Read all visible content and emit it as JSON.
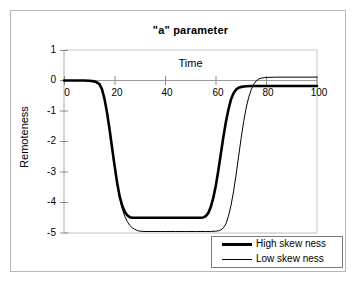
{
  "chart_data": {
    "type": "line",
    "title": "\"a\" parameter",
    "xlabel": "Time",
    "ylabel": "Remoteness",
    "xlim": [
      0,
      100
    ],
    "ylim": [
      -5,
      1
    ],
    "xticks": [
      0,
      20,
      40,
      60,
      80,
      100
    ],
    "yticks": [
      1,
      0,
      -1,
      -2,
      -3,
      -4,
      -5
    ],
    "xtick_labels": [
      "0",
      "20",
      "40",
      "60",
      "80",
      "100"
    ],
    "ytick_labels": [
      "1",
      "0",
      "-1",
      "-2",
      "-3",
      "-4",
      "-5"
    ],
    "grid": false,
    "legend_position": "bottom-right",
    "series": [
      {
        "name": "High skew ness",
        "color": "#000000",
        "linewidth": 2.6,
        "x": [
          0,
          2,
          4,
          6,
          8,
          10,
          12,
          13,
          14,
          15,
          16,
          17,
          18,
          19,
          20,
          21,
          22,
          23,
          24,
          25,
          26,
          27,
          28,
          30,
          34,
          38,
          42,
          46,
          50,
          52,
          54,
          55,
          56,
          57,
          58,
          59,
          60,
          61,
          62,
          63,
          64,
          65,
          66,
          67,
          68,
          69,
          70,
          72,
          74,
          76,
          80,
          85,
          90,
          95,
          100
        ],
        "y": [
          0,
          0,
          0,
          0,
          0,
          -0.01,
          -0.03,
          -0.06,
          -0.12,
          -0.28,
          -0.6,
          -1.05,
          -1.6,
          -2.2,
          -2.8,
          -3.35,
          -3.8,
          -4.1,
          -4.3,
          -4.42,
          -4.48,
          -4.5,
          -4.5,
          -4.5,
          -4.5,
          -4.5,
          -4.5,
          -4.5,
          -4.5,
          -4.5,
          -4.5,
          -4.49,
          -4.45,
          -4.35,
          -4.15,
          -3.85,
          -3.45,
          -2.95,
          -2.4,
          -1.85,
          -1.35,
          -0.95,
          -0.62,
          -0.42,
          -0.3,
          -0.24,
          -0.21,
          -0.19,
          -0.18,
          -0.18,
          -0.18,
          -0.18,
          -0.18,
          -0.18,
          -0.18
        ]
      },
      {
        "name": "Low skew ness",
        "color": "#000000",
        "linewidth": 1.0,
        "x": [
          0,
          2,
          4,
          6,
          8,
          10,
          12,
          14,
          15,
          16,
          17,
          18,
          19,
          20,
          21,
          22,
          23,
          24,
          25,
          26,
          27,
          28,
          29,
          30,
          32,
          36,
          40,
          44,
          48,
          52,
          56,
          58,
          60,
          61,
          62,
          63,
          64,
          65,
          66,
          67,
          68,
          69,
          70,
          71,
          72,
          73,
          74,
          75,
          76,
          77,
          78,
          80,
          84,
          88,
          92,
          96,
          100
        ],
        "y": [
          0,
          0,
          0,
          0,
          0,
          -0.01,
          -0.04,
          -0.14,
          -0.3,
          -0.62,
          -1.08,
          -1.65,
          -2.25,
          -2.85,
          -3.4,
          -3.85,
          -4.2,
          -4.45,
          -4.62,
          -4.75,
          -4.83,
          -4.88,
          -4.92,
          -4.94,
          -4.95,
          -4.95,
          -4.95,
          -4.95,
          -4.95,
          -4.95,
          -4.95,
          -4.95,
          -4.94,
          -4.93,
          -4.9,
          -4.83,
          -4.7,
          -4.45,
          -4.1,
          -3.65,
          -3.1,
          -2.5,
          -1.9,
          -1.35,
          -0.9,
          -0.55,
          -0.3,
          -0.12,
          -0.01,
          0.05,
          0.08,
          0.1,
          0.11,
          0.11,
          0.11,
          0.11,
          0.11
        ]
      }
    ]
  },
  "legend": {
    "items": [
      {
        "label": "High skew ness"
      },
      {
        "label": "Low skew ness"
      }
    ]
  }
}
